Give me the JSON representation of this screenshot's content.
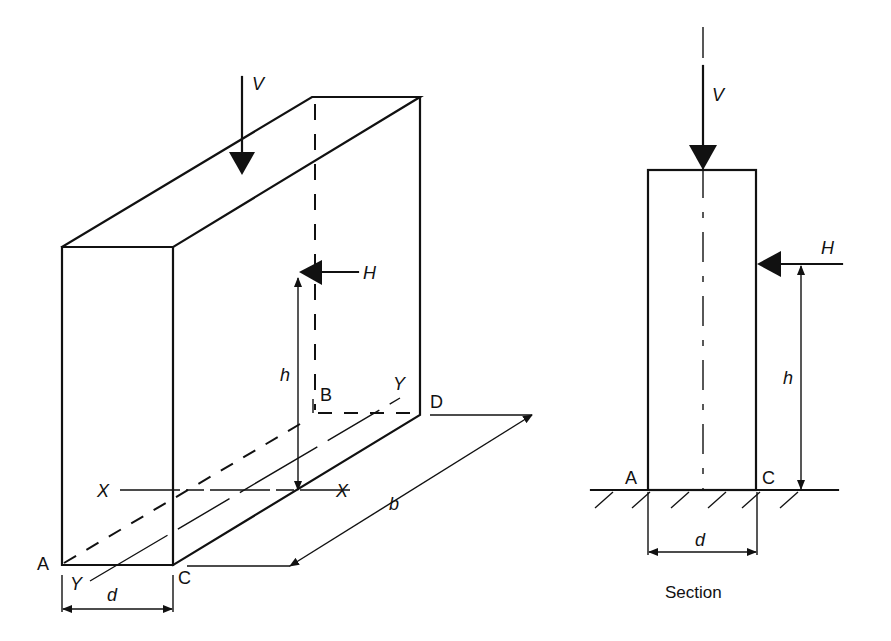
{
  "figure": {
    "isometric_view": {
      "labels": {
        "vertical_load": "V",
        "horizontal_load": "H",
        "height": "h",
        "thickness": "d",
        "length": "b",
        "axis_x_left": "X",
        "axis_x_right": "X",
        "axis_y_top": "Y",
        "axis_y_bottom": "Y",
        "corner_a": "A",
        "corner_b": "B",
        "corner_c": "C",
        "corner_d": "D"
      }
    },
    "section_view": {
      "labels": {
        "vertical_load": "V",
        "horizontal_load": "H",
        "height": "h",
        "thickness": "d",
        "corner_a": "A",
        "corner_c": "C"
      },
      "caption": "Section"
    }
  }
}
